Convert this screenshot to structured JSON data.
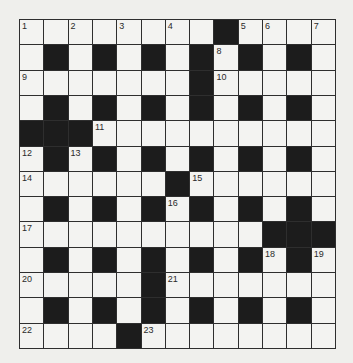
{
  "puzzle": {
    "type": "crossword",
    "rows": 13,
    "cols": 13,
    "colors": {
      "background": "#efefec",
      "white_cell": "#f3f3f1",
      "black_cell": "#1c1c1c",
      "grid_line": "#2e2e2e",
      "number_text": "#2a2a2a"
    },
    "layout": [
      "........#....",
      ".#.#.#.#.#.#.",
      ".......#.....",
      ".#.#.#.#.#.#.",
      "###..........",
      ".#.#.#.#.#.#.",
      "......#......",
      ".#.#.#.#.#.#.",
      "..........###",
      ".#.#.#.#.#.#.",
      ".....#.......",
      ".#.#.#.#.#.#.",
      "....#........"
    ],
    "numbers": [
      {
        "row": 0,
        "col": 0,
        "n": "1"
      },
      {
        "row": 0,
        "col": 2,
        "n": "2"
      },
      {
        "row": 0,
        "col": 4,
        "n": "3"
      },
      {
        "row": 0,
        "col": 6,
        "n": "4"
      },
      {
        "row": 0,
        "col": 9,
        "n": "5"
      },
      {
        "row": 0,
        "col": 10,
        "n": "6"
      },
      {
        "row": 0,
        "col": 12,
        "n": "7"
      },
      {
        "row": 1,
        "col": 8,
        "n": "8"
      },
      {
        "row": 2,
        "col": 0,
        "n": "9"
      },
      {
        "row": 2,
        "col": 8,
        "n": "10"
      },
      {
        "row": 4,
        "col": 3,
        "n": "11"
      },
      {
        "row": 5,
        "col": 0,
        "n": "12"
      },
      {
        "row": 5,
        "col": 2,
        "n": "13"
      },
      {
        "row": 6,
        "col": 0,
        "n": "14"
      },
      {
        "row": 6,
        "col": 7,
        "n": "15"
      },
      {
        "row": 7,
        "col": 6,
        "n": "16"
      },
      {
        "row": 8,
        "col": 0,
        "n": "17"
      },
      {
        "row": 9,
        "col": 10,
        "n": "18"
      },
      {
        "row": 9,
        "col": 12,
        "n": "19"
      },
      {
        "row": 10,
        "col": 0,
        "n": "20"
      },
      {
        "row": 10,
        "col": 6,
        "n": "21"
      },
      {
        "row": 12,
        "col": 0,
        "n": "22"
      },
      {
        "row": 12,
        "col": 5,
        "n": "23"
      }
    ]
  }
}
